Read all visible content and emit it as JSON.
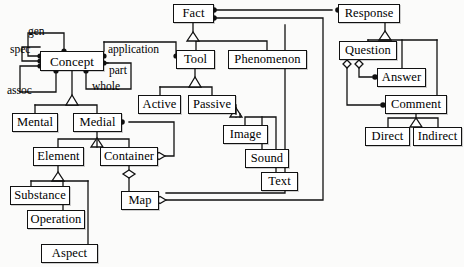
{
  "diagram": {
    "type": "uml-class-diagram",
    "style": {
      "line_color": "#111111",
      "box_fill": "#ffffff",
      "background": "#fbfbfa",
      "text_color": "#000000"
    },
    "nodes": [
      {
        "id": "fact",
        "label": "Fact",
        "x": 173,
        "y": 4,
        "w": 41,
        "h": 19,
        "fs": 12.5
      },
      {
        "id": "response",
        "label": "Response",
        "x": 338,
        "y": 4,
        "w": 62,
        "h": 19,
        "fs": 12.5
      },
      {
        "id": "concept",
        "label": "Concept",
        "x": 40,
        "y": 51,
        "w": 64,
        "h": 20,
        "fs": 13
      },
      {
        "id": "tool",
        "label": "Tool",
        "x": 176,
        "y": 50,
        "w": 39,
        "h": 19,
        "fs": 12.5
      },
      {
        "id": "phenomenon",
        "label": "Phenomenon",
        "x": 228,
        "y": 50,
        "w": 79,
        "h": 19,
        "fs": 12.5
      },
      {
        "id": "question",
        "label": "Question",
        "x": 339,
        "y": 41,
        "w": 58,
        "h": 19,
        "fs": 12.5
      },
      {
        "id": "answer",
        "label": "Answer",
        "x": 377,
        "y": 68,
        "w": 49,
        "h": 19,
        "fs": 12.5
      },
      {
        "id": "comment",
        "label": "Comment",
        "x": 385,
        "y": 95,
        "w": 62,
        "h": 19,
        "fs": 12.5
      },
      {
        "id": "active",
        "label": "Active",
        "x": 138,
        "y": 95,
        "w": 43,
        "h": 19,
        "fs": 12.5
      },
      {
        "id": "passive",
        "label": "Passive",
        "x": 188,
        "y": 95,
        "w": 48,
        "h": 19,
        "fs": 12.5
      },
      {
        "id": "mental",
        "label": "Mental",
        "x": 12,
        "y": 113,
        "w": 46,
        "h": 19,
        "fs": 12.5
      },
      {
        "id": "medial",
        "label": "Medial",
        "x": 73,
        "y": 113,
        "w": 49,
        "h": 19,
        "fs": 12.5
      },
      {
        "id": "image",
        "label": "Image",
        "x": 223,
        "y": 125,
        "w": 45,
        "h": 19,
        "fs": 12.5
      },
      {
        "id": "direct",
        "label": "Direct",
        "x": 365,
        "y": 127,
        "w": 45,
        "h": 19,
        "fs": 12.5
      },
      {
        "id": "indirect",
        "label": "Indirect",
        "x": 413,
        "y": 127,
        "w": 49,
        "h": 19,
        "fs": 12.5
      },
      {
        "id": "element",
        "label": "Element",
        "x": 33,
        "y": 147,
        "w": 51,
        "h": 19,
        "fs": 12.5
      },
      {
        "id": "container",
        "label": "Container",
        "x": 100,
        "y": 147,
        "w": 58,
        "h": 19,
        "fs": 12.5
      },
      {
        "id": "sound",
        "label": "Sound",
        "x": 245,
        "y": 149,
        "w": 44,
        "h": 19,
        "fs": 12.5
      },
      {
        "id": "text",
        "label": "Text",
        "x": 261,
        "y": 172,
        "w": 37,
        "h": 19,
        "fs": 12.5
      },
      {
        "id": "substance",
        "label": "Substance",
        "x": 10,
        "y": 186,
        "w": 60,
        "h": 19,
        "fs": 12.5
      },
      {
        "id": "map",
        "label": "Map",
        "x": 121,
        "y": 191,
        "w": 38,
        "h": 19,
        "fs": 12.5
      },
      {
        "id": "operation",
        "label": "Operation",
        "x": 27,
        "y": 210,
        "w": 58,
        "h": 19,
        "fs": 12.5
      },
      {
        "id": "aspect",
        "label": "Aspect",
        "x": 41,
        "y": 244,
        "w": 57,
        "h": 19,
        "fs": 12.5
      }
    ],
    "edge_labels": [
      {
        "id": "gen",
        "label": "gen",
        "x": 28,
        "y": 26,
        "fs": 11.5
      },
      {
        "id": "spec",
        "label": "spec",
        "x": 10,
        "y": 44,
        "fs": 11.5
      },
      {
        "id": "assoc",
        "label": "assoc",
        "x": 7,
        "y": 85,
        "fs": 11.5
      },
      {
        "id": "application",
        "label": "application",
        "x": 108,
        "y": 44,
        "fs": 11.5
      },
      {
        "id": "part",
        "label": "part",
        "x": 109,
        "y": 65,
        "fs": 11.5
      },
      {
        "id": "whole",
        "label": "whole",
        "x": 92,
        "y": 81,
        "fs": 11.5
      }
    ],
    "relations": [
      {
        "from": "concept",
        "to": "concept",
        "kind": "association",
        "role": "gen"
      },
      {
        "from": "concept",
        "to": "concept",
        "kind": "association",
        "role": "spec"
      },
      {
        "from": "concept",
        "to": "concept",
        "kind": "association",
        "role": "assoc"
      },
      {
        "from": "concept",
        "to": "tool",
        "kind": "association",
        "role": "application"
      },
      {
        "from": "concept",
        "to": "concept",
        "kind": "association",
        "role": "part"
      },
      {
        "from": "concept",
        "to": "concept",
        "kind": "association",
        "role": "whole"
      },
      {
        "from": "tool",
        "to": "fact",
        "kind": "generalization"
      },
      {
        "from": "phenomenon",
        "to": "fact",
        "kind": "generalization"
      },
      {
        "from": "active",
        "to": "tool",
        "kind": "generalization"
      },
      {
        "from": "passive",
        "to": "tool",
        "kind": "generalization"
      },
      {
        "from": "mental",
        "to": "concept",
        "kind": "generalization"
      },
      {
        "from": "medial",
        "to": "concept",
        "kind": "generalization"
      },
      {
        "from": "element",
        "to": "medial",
        "kind": "generalization"
      },
      {
        "from": "container",
        "to": "medial",
        "kind": "generalization"
      },
      {
        "from": "substance",
        "to": "element",
        "kind": "generalization"
      },
      {
        "from": "operation",
        "to": "element",
        "kind": "generalization"
      },
      {
        "from": "aspect",
        "to": "element",
        "kind": "generalization"
      },
      {
        "from": "image",
        "to": "passive",
        "kind": "generalization"
      },
      {
        "from": "sound",
        "to": "passive",
        "kind": "generalization"
      },
      {
        "from": "text",
        "to": "passive",
        "kind": "generalization"
      },
      {
        "from": "question",
        "to": "response",
        "kind": "generalization"
      },
      {
        "from": "answer",
        "to": "response",
        "kind": "generalization"
      },
      {
        "from": "comment",
        "to": "response",
        "kind": "generalization"
      },
      {
        "from": "direct",
        "to": "comment",
        "kind": "generalization"
      },
      {
        "from": "indirect",
        "to": "comment",
        "kind": "generalization"
      },
      {
        "from": "medial",
        "to": "container",
        "kind": "aggregation"
      },
      {
        "from": "container",
        "to": "map",
        "kind": "aggregation"
      },
      {
        "from": "fact",
        "to": "response",
        "kind": "association"
      },
      {
        "from": "fact",
        "to": "map",
        "kind": "association"
      },
      {
        "from": "question",
        "to": "answer",
        "kind": "aggregation"
      },
      {
        "from": "question",
        "to": "comment",
        "kind": "aggregation"
      }
    ]
  }
}
